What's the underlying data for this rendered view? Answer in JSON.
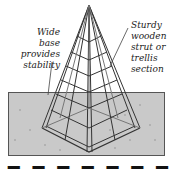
{
  "diagram": {
    "labels": {
      "left": [
        "Wide",
        "base",
        "provides",
        "stability"
      ],
      "right": [
        "Sturdy",
        "wooden",
        "strut or",
        "trellis",
        "section"
      ]
    },
    "caption_partial": "▬ ▬ ▬ ▬ ▬ ▬ ▬ ▬",
    "colors": {
      "ground": "#c9c9c9",
      "wood": "#f0f0f0",
      "outline": "#333333"
    }
  }
}
